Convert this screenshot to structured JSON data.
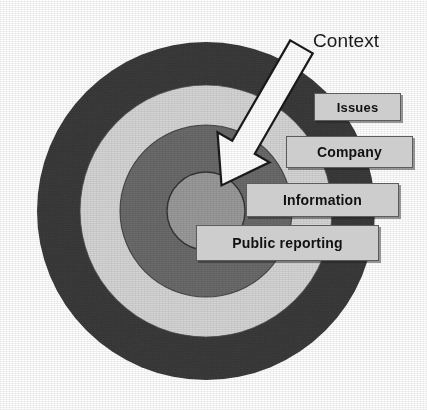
{
  "diagram": {
    "kind": "concentric-circles-bullseye",
    "title_visible": false,
    "background_color": "#ffffff",
    "center": {
      "x": 206,
      "y": 211
    },
    "rings": [
      {
        "name": "outer-ring",
        "order": 1,
        "radius": 169,
        "color": "#3b3b3b",
        "label": ""
      },
      {
        "name": "second-ring",
        "order": 2,
        "radius": 126,
        "color": "#d7d7d7",
        "label": ""
      },
      {
        "name": "third-ring",
        "order": 3,
        "radius": 86,
        "color": "#6d6d6d",
        "label": ""
      },
      {
        "name": "core-circle",
        "order": 4,
        "radius": 39,
        "color": "#9b9b9b",
        "label": ""
      }
    ],
    "callout": {
      "text": "Context",
      "arrow_color": "#ffffff",
      "arrow_outline_color": "#1a1a1a",
      "points_to": "core-circle",
      "tail": {
        "x": 300,
        "y": 48
      },
      "tip": {
        "x": 222,
        "y": 186
      }
    },
    "label_boxes": [
      {
        "id": "issues",
        "text": "Issues",
        "ring": "outer-ring",
        "fill": "#cdcdcd",
        "border": "#5c5c5c",
        "text_color": "#111111"
      },
      {
        "id": "company",
        "text": "Company",
        "ring": "second-ring",
        "fill": "#cdcdcd",
        "border": "#5c5c5c",
        "text_color": "#111111"
      },
      {
        "id": "information",
        "text": "Information",
        "ring": "third-ring",
        "fill": "#cdcdcd",
        "border": "#5c5c5c",
        "text_color": "#111111"
      },
      {
        "id": "public_reporting",
        "text": "Public reporting",
        "ring": "core-circle",
        "fill": "#cdcdcd",
        "border": "#5c5c5c",
        "text_color": "#111111"
      }
    ]
  }
}
